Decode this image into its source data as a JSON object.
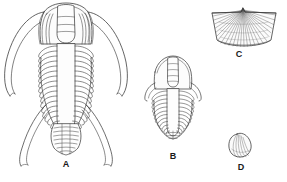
{
  "plate": {
    "title": "Fossil specimens plate",
    "background_color": "#ffffff",
    "ink_color": "#3a3a3a",
    "fill_color": "#fbfbfb",
    "label_color": "#1a1a1a",
    "figures": [
      {
        "key": "A",
        "label": "A",
        "name": "trilobite-long-genal-spines",
        "description": "Large trilobite in dorsal view with broad cephalon, long curved genal spines, segmented thorax and long posterior spines",
        "thorax_segment_count": 16,
        "pygidium_segment_count": 8
      },
      {
        "key": "B",
        "label": "B",
        "name": "trilobite-short-genal-spines",
        "description": "Smaller trilobite in dorsal view with rounded cephalon, short genal spines and tapering segmented thorax",
        "thorax_segment_count": 14,
        "pygidium_segment_count": 5
      },
      {
        "key": "C",
        "label": "C",
        "name": "brachiopod-shell-fan",
        "description": "Trapezoidal brachiopod valve with pointed beak at top centre and radiating ribs fanning to the margin",
        "rib_count": 26
      },
      {
        "key": "D",
        "label": "D",
        "name": "small-rounded-shell",
        "description": "Small rounded shell with concentric growth lines and a narrow umbo at upper left",
        "growth_line_count": 6
      }
    ]
  }
}
